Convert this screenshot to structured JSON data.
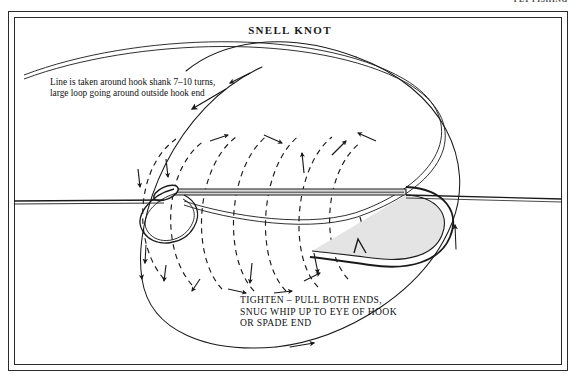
{
  "page": {
    "running_header": "FLY FISHING",
    "title": "SNELL KNOT",
    "background_color": "#ffffff",
    "ink_color": "#1a1a1a",
    "frame_color": "#2b2b2b"
  },
  "annotations": {
    "top_note": "Line is taken around hook shank 7–10 turns,\nlarge loop going around outside hook end",
    "bottom_note": "TIGHTEN – PULL BOTH ENDS,\nSNUG WHIP UP TO EYE OF HOOK\nOR SPADE END"
  },
  "diagram": {
    "type": "instructional-line-drawing",
    "elements": [
      {
        "name": "hook-shank",
        "style": "solid double line",
        "note": "horizontal shank running left to right"
      },
      {
        "name": "hook-eye",
        "style": "solid closed loop",
        "note": "oval eye at left end of shank"
      },
      {
        "name": "hook-bend",
        "style": "solid tapered curve",
        "note": "curving down and back at right"
      },
      {
        "name": "hook-point-barb",
        "style": "solid",
        "note": "barbed point facing left"
      },
      {
        "name": "standing-line",
        "style": "solid single line",
        "note": "enters frame from left edge through eye"
      },
      {
        "name": "tag-line",
        "style": "solid single line",
        "note": "exits right past the bend"
      },
      {
        "name": "wrap-turns",
        "style": "dashed arcs with arrowheads",
        "count": 7,
        "note": "turns around shank, 7–10 turns"
      },
      {
        "name": "large-loop",
        "style": "solid ellipse with arrowheads",
        "note": "large loop going around outside hook end"
      }
    ],
    "wrap_turn_count_label": "7–10 turns"
  }
}
